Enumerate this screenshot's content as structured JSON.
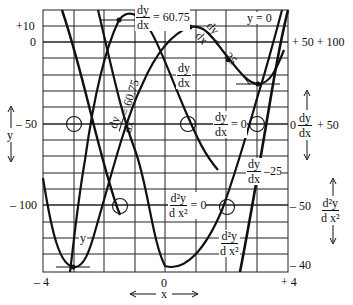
{
  "diagram": {
    "x_axis": {
      "label": "x",
      "ticks": [
        {
          "value": "– 4"
        },
        {
          "value": "0"
        },
        {
          "value": "+ 4"
        }
      ]
    },
    "left_axis": {
      "label": "y",
      "ticks": [
        {
          "value": "+10"
        },
        {
          "value": "0"
        },
        {
          "value": "– 50"
        },
        {
          "value": "– 100"
        }
      ]
    },
    "right_axis_dy": {
      "label_num": "dy",
      "label_den": "dx",
      "ticks": [
        {
          "value": "+ 50 + 100"
        },
        {
          "value": "0"
        },
        {
          "value": "+ 50"
        }
      ]
    },
    "right_axis_d2y": {
      "label_num": "d²y",
      "label_den": "d x²",
      "ticks": [
        {
          "value": "– 50"
        },
        {
          "value": "– 40"
        }
      ]
    },
    "annotations": {
      "max_slope_top": {
        "num": "dy",
        "den": "dx",
        "eq": "= 60.75"
      },
      "max_slope_diag": {
        "num": "dy",
        "den": "dx",
        "eq": "= 60.75"
      },
      "min_slope_diag": {
        "num": "dy",
        "den": "dx",
        "eq": "= – 25"
      },
      "y_zero": "y = 0",
      "dydx_curve_label": {
        "num": "dy",
        "den": "dx"
      },
      "dydx_zero": {
        "num": "dy",
        "den": "dx",
        "eq": "= 0"
      },
      "dydx_min": {
        "num": "dy",
        "den": "dx",
        "eq": "–25"
      },
      "d2y_zero": {
        "num": "d²y",
        "den": "d x²",
        "eq": "= 0"
      },
      "d2y_curve_label": {
        "num": "d²y",
        "den": "d x²"
      },
      "y_curve_label": "y"
    },
    "colors": {
      "ink": "#111111",
      "grid": "#222222",
      "background": "#ffffff"
    }
  }
}
